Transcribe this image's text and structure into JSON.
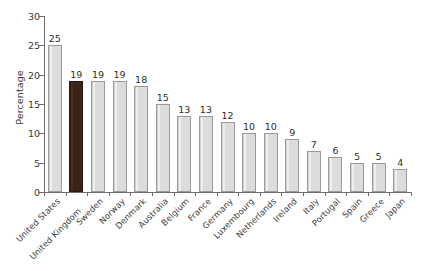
{
  "chart_data": {
    "type": "bar",
    "title": "",
    "xlabel": "",
    "ylabel": "Percentage",
    "ylim": [
      0,
      30
    ],
    "yticks": [
      0,
      5,
      10,
      15,
      20,
      25,
      30
    ],
    "grid": false,
    "legend": null,
    "categories": [
      "United States",
      "United Kingdom",
      "Sweden",
      "Norway",
      "Denmark",
      "Australia",
      "Belgium",
      "France",
      "Germany",
      "Luxembourg",
      "Netherlands",
      "Ireland",
      "Italy",
      "Portugal",
      "Spain",
      "Greece",
      "Japan"
    ],
    "values": [
      25,
      19,
      19,
      19,
      18,
      15,
      13,
      13,
      12,
      10,
      10,
      9,
      7,
      6,
      5,
      5,
      4
    ],
    "data_labels": [
      "25",
      "19",
      "19",
      "19",
      "18",
      "15",
      "13",
      "13",
      "12",
      "10",
      "10",
      "9",
      "7",
      "6",
      "5",
      "5",
      "4"
    ],
    "highlight_index": 1,
    "colors": {
      "bar_fill": "#dcdcda",
      "bar_edge": "#9a9a98",
      "highlight_fill": "#3a2318",
      "highlight_edge": "#2a1810",
      "axis": "#6e6e6e",
      "text": "#3b3b3b",
      "background": "#ffffff"
    }
  }
}
